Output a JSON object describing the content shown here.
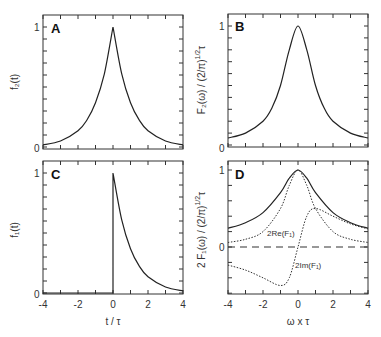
{
  "chart_data": [
    {
      "panel": "A",
      "type": "line",
      "ylabel": "f₂(t)",
      "xlabel": "",
      "xlim": [
        -4,
        4
      ],
      "ylim": [
        0,
        1.05
      ],
      "yticks_labeled": [
        0,
        1
      ],
      "series": [
        {
          "name": "f2(t)",
          "style": "solid",
          "x": [
            -4,
            -3,
            -2,
            -1.5,
            -1,
            -0.5,
            0,
            0.5,
            1,
            1.5,
            2,
            3,
            4
          ],
          "y": [
            0.018,
            0.05,
            0.135,
            0.223,
            0.368,
            0.607,
            1.0,
            0.607,
            0.368,
            0.223,
            0.135,
            0.05,
            0.018
          ]
        }
      ]
    },
    {
      "panel": "B",
      "type": "line",
      "ylabel": "F₂(ω) / (2/π)^1/2 τ",
      "xlabel": "",
      "xlim": [
        -4,
        4
      ],
      "ylim": [
        0,
        1.05
      ],
      "yticks_labeled": [
        0,
        1
      ],
      "series": [
        {
          "name": "F2(omega)",
          "style": "solid",
          "x": [
            -4,
            -3,
            -2,
            -1.5,
            -1,
            -0.5,
            0,
            0.5,
            1,
            1.5,
            2,
            3,
            4
          ],
          "y": [
            0.059,
            0.1,
            0.2,
            0.308,
            0.5,
            0.8,
            1.0,
            0.8,
            0.5,
            0.308,
            0.2,
            0.1,
            0.059
          ]
        }
      ]
    },
    {
      "panel": "C",
      "type": "line",
      "ylabel": "f₁(t)",
      "xlabel": "t / τ",
      "xlim": [
        -4,
        4
      ],
      "ylim": [
        0,
        1.05
      ],
      "xticks": [
        -4,
        -2,
        0,
        2,
        4
      ],
      "yticks_labeled": [
        0,
        1
      ],
      "series": [
        {
          "name": "f1(t)",
          "style": "solid",
          "x": [
            -4,
            -2,
            0,
            0,
            0.5,
            1,
            1.5,
            2,
            3,
            4
          ],
          "y": [
            0,
            0,
            0,
            1.0,
            0.607,
            0.368,
            0.223,
            0.135,
            0.05,
            0.018
          ]
        }
      ]
    },
    {
      "panel": "D",
      "type": "line",
      "ylabel": "2 F₁(ω) / (2/π)^1/2 τ",
      "xlabel": "ω x τ",
      "xlim": [
        -4,
        4
      ],
      "ylim": [
        -0.61,
        1.12
      ],
      "xticks": [
        -4,
        -2,
        0,
        2,
        4
      ],
      "yticks_labeled": [
        0,
        1
      ],
      "annotations": [
        "2Re(F₁)",
        "2Im(F₁)"
      ],
      "series": [
        {
          "name": "|2F1|",
          "style": "solid",
          "x": [
            -4,
            -3,
            -2,
            -1,
            -0.5,
            0,
            0.5,
            1,
            2,
            3,
            4
          ],
          "y": [
            0.243,
            0.316,
            0.447,
            0.707,
            0.894,
            1.0,
            0.894,
            0.707,
            0.447,
            0.316,
            0.243
          ]
        },
        {
          "name": "2Re(F1)",
          "style": "dotted",
          "x": [
            -4,
            -3,
            -2,
            -1,
            -0.5,
            0,
            0.5,
            1,
            2,
            3,
            4
          ],
          "y": [
            0.059,
            0.1,
            0.2,
            0.5,
            0.8,
            1.0,
            0.8,
            0.5,
            0.2,
            0.1,
            0.059
          ]
        },
        {
          "name": "2Im(F1)",
          "style": "dotted",
          "x": [
            -4,
            -3,
            -2,
            -1,
            -0.5,
            0,
            0.5,
            1,
            2,
            3,
            4
          ],
          "y": [
            -0.235,
            -0.3,
            -0.4,
            -0.5,
            -0.4,
            0,
            0.4,
            0.5,
            0.4,
            0.3,
            0.235
          ]
        },
        {
          "name": "zero",
          "style": "dashed",
          "x": [
            -4,
            4
          ],
          "y": [
            0,
            0
          ]
        }
      ]
    }
  ],
  "panels": {
    "A": {
      "letter": "A",
      "ylabel": "f₂(t)",
      "y1": "1",
      "y0": "0"
    },
    "B": {
      "letter": "B",
      "ylabel": "F₂(ω) / (2/π)",
      "ylabel_sup": "1/2",
      "ylabel_tail": "τ",
      "y1": "1",
      "y0": "0"
    },
    "C": {
      "letter": "C",
      "ylabel": "f₁(t)",
      "y1": "1",
      "y0": "0",
      "xlabel": "t / τ",
      "xticks": [
        "-4",
        "-2",
        "0",
        "2",
        "4"
      ]
    },
    "D": {
      "letter": "D",
      "ylabel": "2 F₁(ω) / (2/π)",
      "ylabel_sup": "1/2",
      "ylabel_tail": "τ",
      "y1": "1",
      "y0": "0",
      "xlabel": "ω x τ",
      "xticks": [
        "-4",
        "-2",
        "0",
        "2",
        "4"
      ],
      "re_label": "2Re(F₁)",
      "im_label": "2Im(F₁)"
    }
  },
  "colors": {
    "line": "#222222",
    "frame": "#333333",
    "background": "#ffffff"
  }
}
